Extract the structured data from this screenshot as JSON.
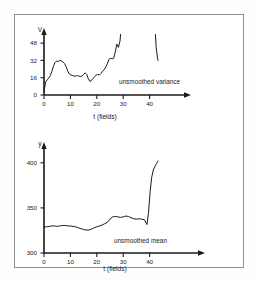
{
  "figure": {
    "background_color": "#ffffff",
    "border_color": "#8f8f8f",
    "ink_color": "#1a1a1a"
  },
  "chart_data": [
    {
      "id": "unsmoothed-variance",
      "type": "line",
      "title": "",
      "annotation": "unsmoothed variance",
      "xlabel": "t (fields)",
      "ylabel": "V",
      "xlim": [
        0,
        46
      ],
      "ylim": [
        0,
        56
      ],
      "xticks": [
        0,
        10,
        20,
        30,
        40
      ],
      "yticks": [
        0,
        16,
        32,
        48
      ],
      "xticklabels": [
        "0",
        "10",
        "20",
        "30",
        "40"
      ],
      "yticklabels": [
        "0",
        "16",
        "32",
        "48"
      ],
      "grid": false,
      "legend": "none",
      "x": [
        0,
        0.6,
        1.2,
        1.8,
        2.4,
        3.0,
        3.6,
        4.2,
        4.8,
        5.4,
        6.0,
        6.6,
        7.2,
        7.8,
        8.4,
        9.0,
        9.6,
        10.2,
        10.8,
        11.4,
        12.0,
        12.6,
        13.2,
        13.8,
        14.4,
        15.0,
        15.6,
        16.2,
        16.8,
        17.4,
        18.0,
        18.6,
        19.2,
        19.8,
        20.4,
        21.0,
        21.6,
        22.2,
        22.8,
        23.4,
        24.0,
        24.6,
        25.2,
        25.8,
        26.4,
        27.0,
        27.6,
        28.2,
        28.8,
        29.0
      ],
      "values": [
        3,
        12,
        14,
        15.5,
        18,
        22,
        27,
        30,
        31.5,
        31,
        32,
        31.5,
        30.5,
        29,
        26,
        22,
        19.5,
        18.5,
        18,
        17.5,
        17.5,
        18,
        17.5,
        17,
        17.5,
        19,
        20.5,
        19,
        15,
        12.5,
        13.5,
        15.5,
        17,
        18.5,
        19,
        18.5,
        20,
        22,
        23.5,
        26,
        29,
        33,
        34,
        33.5,
        34,
        40,
        47,
        44,
        50,
        56
      ],
      "secondary_trace": {
        "name": "spike",
        "x": [
          42.2,
          42.5,
          43.0,
          43.2
        ],
        "values": [
          56,
          44,
          34,
          32
        ]
      }
    },
    {
      "id": "unsmoothed-mean",
      "type": "line",
      "title": "",
      "annotation": "unsmoothed mean",
      "xlabel": "t (fields)",
      "ylabel": "y",
      "xlim": [
        0,
        46
      ],
      "ylim": [
        300,
        415
      ],
      "xticks": [
        0,
        10,
        20,
        30,
        40
      ],
      "yticks": [
        300,
        350,
        400
      ],
      "xticklabels": [
        "0",
        "10",
        "20",
        "30",
        "40"
      ],
      "yticklabels": [
        "300",
        "350",
        "400"
      ],
      "grid": false,
      "legend": "none",
      "x": [
        0,
        1,
        2,
        3,
        4,
        5,
        6,
        7,
        8,
        9,
        10,
        11,
        12,
        13,
        14,
        15,
        16,
        17,
        18,
        19,
        20,
        21,
        22,
        23,
        24,
        25,
        26,
        27,
        28,
        29,
        30,
        31,
        32,
        33,
        34,
        35,
        36,
        37,
        38,
        39,
        39.6,
        40.2,
        40.8,
        41.4,
        42.0,
        42.6,
        43.2
      ],
      "values": [
        329,
        329,
        329.5,
        330,
        330,
        329.5,
        330,
        330.5,
        330.5,
        330,
        330,
        329.5,
        329,
        328,
        327,
        326,
        325.5,
        325.5,
        326.5,
        328,
        329,
        330,
        331,
        332.5,
        334,
        337.5,
        340,
        340.5,
        340,
        339.5,
        340,
        341,
        340.5,
        339,
        338,
        337.5,
        338,
        337.5,
        337,
        331.5,
        345,
        368,
        384,
        392,
        396,
        399,
        402
      ]
    }
  ]
}
